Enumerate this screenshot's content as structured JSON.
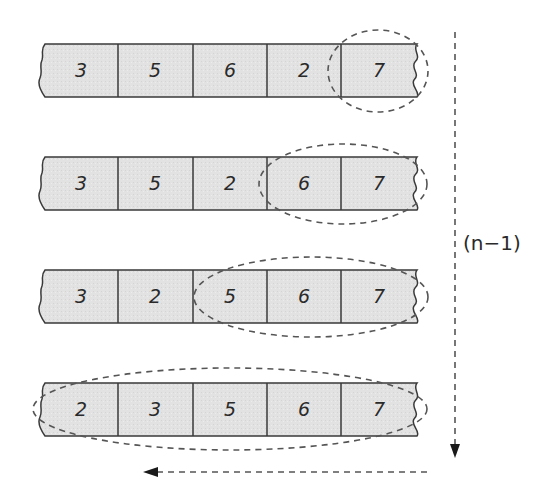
{
  "diagram": {
    "colors": {
      "cell_fill": "#e2e2e2",
      "stroke": "#3a3a3a",
      "dash": "#555555",
      "background": "#ffffff"
    },
    "rows": [
      {
        "values": [
          "3",
          "5",
          "6",
          "2",
          "7"
        ],
        "sorted_count": 1
      },
      {
        "values": [
          "3",
          "5",
          "2",
          "6",
          "7"
        ],
        "sorted_count": 2
      },
      {
        "values": [
          "3",
          "2",
          "5",
          "6",
          "7"
        ],
        "sorted_count": 3
      },
      {
        "values": [
          "2",
          "3",
          "5",
          "6",
          "7"
        ],
        "sorted_count": 5
      }
    ],
    "passes_label": "(n−1)",
    "vertical_arrow": "down",
    "horizontal_arrow": "left"
  }
}
